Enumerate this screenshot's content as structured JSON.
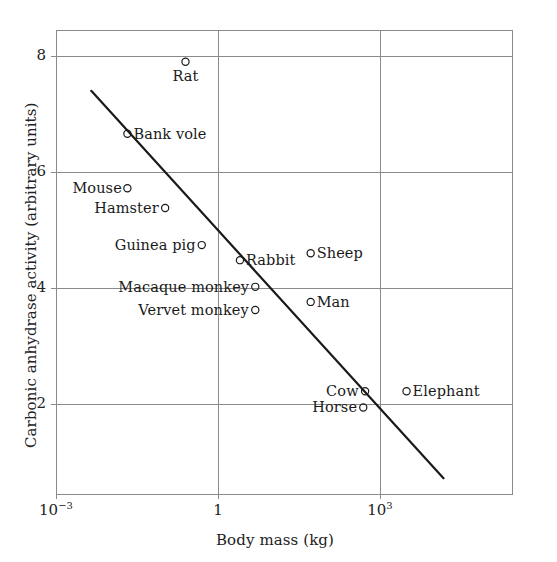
{
  "chart_data": {
    "type": "scatter",
    "title": "",
    "xlabel": "Body mass (kg)",
    "ylabel": "Carbonic anhydrase activity (arbitrary units)",
    "x_scale": "log",
    "y_scale": "linear",
    "xlim": [
      0.001,
      31622.8
    ],
    "ylim": [
      0.55,
      8.8
    ],
    "xticks": [
      {
        "value": 0.001,
        "label_base": "10",
        "label_exp": "−3"
      },
      {
        "value": 1,
        "label_base": "1",
        "label_exp": ""
      },
      {
        "value": 1000,
        "label_base": "10",
        "label_exp": "3"
      }
    ],
    "yticks": [
      {
        "value": 8,
        "label": "8"
      },
      {
        "value": 6,
        "label": "6"
      },
      {
        "value": 4,
        "label": "4"
      },
      {
        "value": 2,
        "label": "2"
      }
    ],
    "grid": true,
    "legend": "none",
    "marker": "open-circle",
    "points": [
      {
        "name": "Rat",
        "x": 0.25,
        "y": 7.9,
        "label_pos": "below"
      },
      {
        "name": "Bank vole",
        "x": 0.021,
        "y": 6.66,
        "label_pos": "right"
      },
      {
        "name": "Mouse",
        "x": 0.021,
        "y": 5.72,
        "label_pos": "left"
      },
      {
        "name": "Hamster",
        "x": 0.105,
        "y": 5.38,
        "label_pos": "left"
      },
      {
        "name": "Guinea pig",
        "x": 0.5,
        "y": 4.74,
        "label_pos": "left"
      },
      {
        "name": "Rabbit",
        "x": 2.55,
        "y": 4.48,
        "label_pos": "right"
      },
      {
        "name": "Sheep",
        "x": 52,
        "y": 4.6,
        "label_pos": "right"
      },
      {
        "name": "Macaque monkey",
        "x": 4.9,
        "y": 4.02,
        "label_pos": "left"
      },
      {
        "name": "Man",
        "x": 52,
        "y": 3.76,
        "label_pos": "right"
      },
      {
        "name": "Vervet monkey",
        "x": 4.9,
        "y": 3.62,
        "label_pos": "left"
      },
      {
        "name": "Cow",
        "x": 530,
        "y": 2.22,
        "label_pos": "left"
      },
      {
        "name": "Elephant",
        "x": 3100,
        "y": 2.22,
        "label_pos": "right"
      },
      {
        "name": "Horse",
        "x": 490,
        "y": 1.94,
        "label_pos": "left"
      }
    ],
    "trend_line": {
      "x_start": 0.0045,
      "y_start": 7.4,
      "x_end": 15000,
      "y_end": 0.72,
      "color": "#1a1a1a"
    },
    "colors": {
      "axis": "#8a8a8a",
      "grid": "#8a8a8a",
      "marker": "#1a1a1a",
      "text": "#1a1a1a",
      "background": "#ffffff"
    }
  }
}
